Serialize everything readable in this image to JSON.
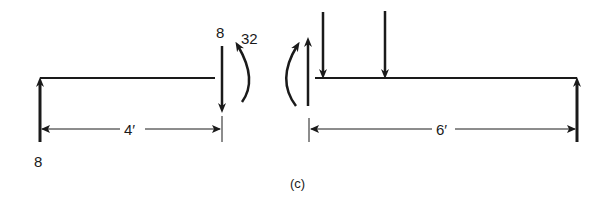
{
  "figure": {
    "caption": "(c)",
    "left_segment": {
      "reaction_label": "8",
      "shear_label": "8",
      "moment_label": "32",
      "length_label": "4′"
    },
    "right_segment": {
      "length_label": "6′"
    }
  },
  "colors": {
    "ink": "#1a1a1a",
    "background": "#ffffff"
  }
}
